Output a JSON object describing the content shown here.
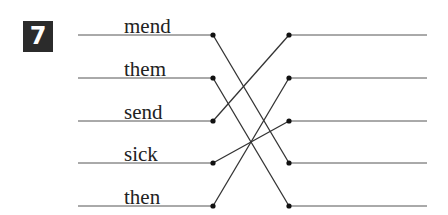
{
  "exercise": {
    "number": "7",
    "words": [
      "mend",
      "them",
      "send",
      "sick",
      "then"
    ],
    "connections": [
      {
        "from": 0,
        "to": 3
      },
      {
        "from": 1,
        "to": 4
      },
      {
        "from": 2,
        "to": 0
      },
      {
        "from": 3,
        "to": 2
      },
      {
        "from": 4,
        "to": 1
      }
    ],
    "colors": {
      "line": "#333333",
      "badge_bg": "#2b2b2b",
      "badge_text": "#ffffff",
      "text": "#222222"
    }
  }
}
